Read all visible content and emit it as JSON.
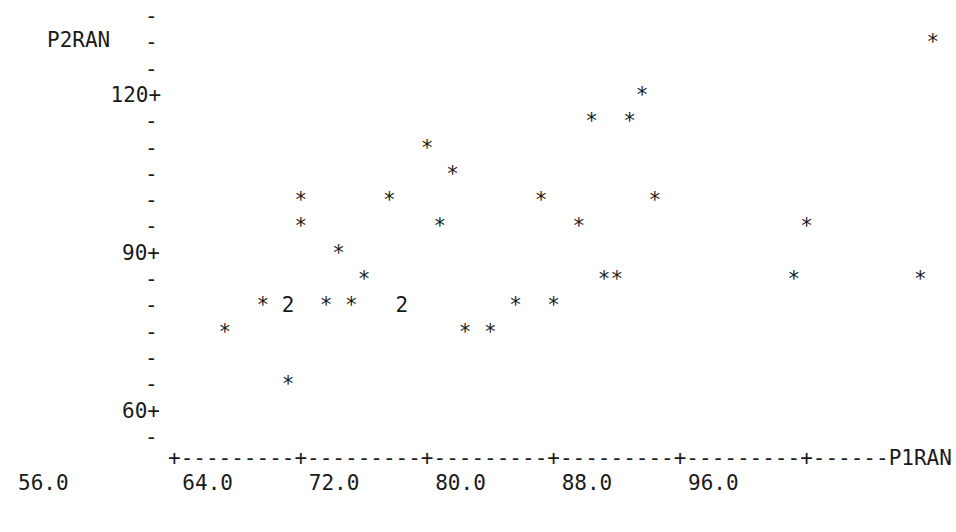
{
  "plot": {
    "kind": "minitab-character-scatterplot",
    "y_variable_label": "P2RAN",
    "x_variable_label": "P1RAN",
    "background_color": "#ffffff",
    "text_color": "#1a1a1a",
    "point_glyph": "*",
    "overlap_glyph": "2",
    "tick_glyph_y": "-",
    "tick_glyph_major": "+",
    "axis_fill_glyph": "-",
    "char_cell_width_px": 11.5,
    "char_cell_height_px": 26.3,
    "y_axis": {
      "labeled_ticks": [
        "120+",
        "90+",
        "60+"
      ],
      "row_count": 17,
      "values_top_to_bottom": [
        135,
        130,
        125,
        120,
        115,
        110,
        105,
        100,
        95,
        90,
        85,
        80,
        75,
        70,
        65,
        60,
        55
      ],
      "ticklabel_rows": {
        "120": 3,
        "90": 9,
        "60": 15
      }
    },
    "x_axis": {
      "tick_labels": [
        "56.0",
        "64.0",
        "72.0",
        "80.0",
        "88.0",
        "96.0"
      ],
      "major_tick_values": [
        64.0,
        72.0,
        80.0,
        88.0,
        96.0,
        104.0
      ],
      "dashes_between_majors": 9,
      "trailing_dashes": 6,
      "units_per_char": 0.8,
      "left_label_offscale": "56.0"
    },
    "rows": [
      "                                                                    ",
      "                                                            *       ",
      "                                                                    ",
      "                                     *                              ",
      "                                 *  *                               ",
      "                    *                                               ",
      "                      *                                             ",
      "          *      *           *        *                             ",
      "          *          *          *                 *                 ",
      "             *                                                      ",
      "               *                  **             *         *        ",
      "       * 2  * *   2        *  *                                     ",
      "    *                  * *                                          ",
      "                                                                    ",
      "         *                                                          ",
      "                                                                    ",
      "                                                                    "
    ],
    "data_points": [
      {
        "x": 97.6,
        "y": 132.5,
        "glyph": "*"
      },
      {
        "x": 84.8,
        "y": 117.5,
        "glyph": "*"
      },
      {
        "x": 81.6,
        "y": 112.5,
        "glyph": "*"
      },
      {
        "x": 83.2,
        "y": 112.5,
        "glyph": "*"
      },
      {
        "x": 71.2,
        "y": 107.5,
        "glyph": "*"
      },
      {
        "x": 72.8,
        "y": 102.5,
        "glyph": "*"
      },
      {
        "x": 95.2,
        "y": 102.5,
        "glyph": "*"
      },
      {
        "x": 67.2,
        "y": 97.5,
        "glyph": "*"
      },
      {
        "x": 72.8,
        "y": 97.5,
        "glyph": "*"
      },
      {
        "x": 80.0,
        "y": 97.5,
        "glyph": "*"
      },
      {
        "x": 88.8,
        "y": 97.5,
        "glyph": "*"
      },
      {
        "x": 67.2,
        "y": 92.5,
        "glyph": "*"
      },
      {
        "x": 72.8,
        "y": 92.5,
        "glyph": "*"
      },
      {
        "x": 79.2,
        "y": 92.5,
        "glyph": "*"
      },
      {
        "x": 90.4,
        "y": 92.5,
        "glyph": "*"
      },
      {
        "x": 69.6,
        "y": 87.5,
        "glyph": "*"
      },
      {
        "x": 70.4,
        "y": 82.5,
        "glyph": "*"
      },
      {
        "x": 77.6,
        "y": 82.5,
        "glyph": "*"
      },
      {
        "x": 78.4,
        "y": 82.5,
        "glyph": "*"
      },
      {
        "x": 92.0,
        "y": 82.5,
        "glyph": "*"
      },
      {
        "x": 96.8,
        "y": 82.5,
        "glyph": "*"
      },
      {
        "x": 65.6,
        "y": 77.5,
        "glyph": "*"
      },
      {
        "x": 66.4,
        "y": 77.5,
        "glyph": "2"
      },
      {
        "x": 68.8,
        "y": 77.5,
        "glyph": "*"
      },
      {
        "x": 69.6,
        "y": 77.5,
        "glyph": "*"
      },
      {
        "x": 72.8,
        "y": 77.5,
        "glyph": "2"
      },
      {
        "x": 76.0,
        "y": 77.5,
        "glyph": "*"
      },
      {
        "x": 77.6,
        "y": 77.5,
        "glyph": "*"
      },
      {
        "x": 64.8,
        "y": 72.5,
        "glyph": "*"
      },
      {
        "x": 73.6,
        "y": 72.5,
        "glyph": "*"
      },
      {
        "x": 74.4,
        "y": 72.5,
        "glyph": "*"
      },
      {
        "x": 67.2,
        "y": 62.5,
        "glyph": "*"
      }
    ]
  }
}
